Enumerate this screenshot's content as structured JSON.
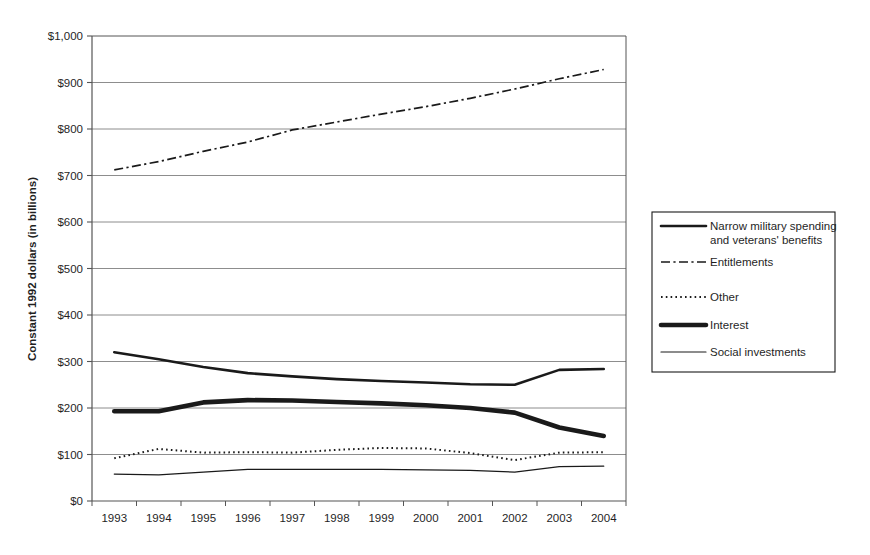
{
  "chart_data": {
    "type": "line",
    "title": "",
    "xlabel": "",
    "ylabel": "Constant 1992 dollars (in billions)",
    "categories": [
      "1993",
      "1994",
      "1995",
      "1996",
      "1997",
      "1998",
      "1999",
      "2000",
      "2001",
      "2002",
      "2003",
      "2004"
    ],
    "ylim": [
      0,
      1000
    ],
    "ytick_values": [
      0,
      100,
      200,
      300,
      400,
      500,
      600,
      700,
      800,
      900,
      1000
    ],
    "ytick_labels": [
      "$0",
      "$100",
      "$200",
      "$300",
      "$400",
      "$500",
      "$600",
      "$700",
      "$800",
      "$900",
      "$1,000"
    ],
    "grid": "horizontal",
    "legend_position": "right",
    "series": [
      {
        "name": "Narrow military spending and veterans' benefits",
        "style": "solid-medium",
        "values": [
          320,
          305,
          288,
          275,
          268,
          262,
          258,
          255,
          251,
          250,
          282,
          284
        ]
      },
      {
        "name": "Entitlements",
        "style": "dash-dot",
        "values": [
          712,
          730,
          752,
          772,
          798,
          815,
          832,
          848,
          866,
          886,
          908,
          928
        ]
      },
      {
        "name": "Other",
        "style": "dotted",
        "values": [
          92,
          112,
          104,
          105,
          104,
          110,
          114,
          113,
          103,
          88,
          104,
          105
        ]
      },
      {
        "name": "Interest",
        "style": "solid-thick",
        "values": [
          193,
          193,
          212,
          217,
          216,
          213,
          210,
          206,
          200,
          190,
          158,
          140
        ]
      },
      {
        "name": "Social investments",
        "style": "solid-thin",
        "values": [
          58,
          56,
          62,
          68,
          68,
          68,
          68,
          67,
          66,
          62,
          74,
          75
        ]
      }
    ]
  },
  "axis": {
    "y_title": "Constant 1992 dollars (in billions)"
  },
  "legend": {
    "entries": [
      {
        "label_line1": "Narrow military spending",
        "label_line2": "and veterans' benefits",
        "style": "solid-medium"
      },
      {
        "label_line1": "Entitlements",
        "label_line2": "",
        "style": "dash-dot"
      },
      {
        "label_line1": "Other",
        "label_line2": "",
        "style": "dotted"
      },
      {
        "label_line1": "Interest",
        "label_line2": "",
        "style": "solid-thick"
      },
      {
        "label_line1": "Social investments",
        "label_line2": "",
        "style": "solid-thin"
      }
    ]
  },
  "colors": {
    "line": "#1a1a1a",
    "grid": "#808080",
    "axis": "#555555",
    "background": "#ffffff"
  }
}
